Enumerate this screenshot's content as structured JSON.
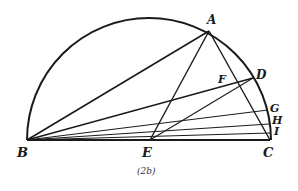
{
  "figure": {
    "caption": "(2b)",
    "colors": {
      "ink": "#1a1a1a",
      "background": "#ffffff"
    },
    "semicircle": {
      "cx": 149,
      "cy": 140,
      "r": 122
    },
    "points": {
      "A": {
        "label": "A",
        "x": 209,
        "y": 31
      },
      "B": {
        "label": "B",
        "x": 27,
        "y": 140
      },
      "C": {
        "label": "C",
        "x": 270,
        "y": 140
      },
      "D": {
        "label": "D",
        "x": 253,
        "y": 78
      },
      "E": {
        "label": "E",
        "x": 150,
        "y": 140
      },
      "F": {
        "label": "F",
        "x": 237,
        "y": 84
      },
      "G": {
        "label": "G",
        "x": 268,
        "y": 110
      },
      "H": {
        "label": "H",
        "x": 269,
        "y": 124
      },
      "I": {
        "label": "I",
        "x": 270,
        "y": 133
      }
    },
    "segments": [
      [
        "B",
        "C"
      ],
      [
        "B",
        "A"
      ],
      [
        "A",
        "C"
      ],
      [
        "A",
        "E"
      ],
      [
        "B",
        "D"
      ],
      [
        "E",
        "D"
      ],
      [
        "B",
        "G"
      ],
      [
        "B",
        "H"
      ],
      [
        "B",
        "I"
      ]
    ]
  }
}
